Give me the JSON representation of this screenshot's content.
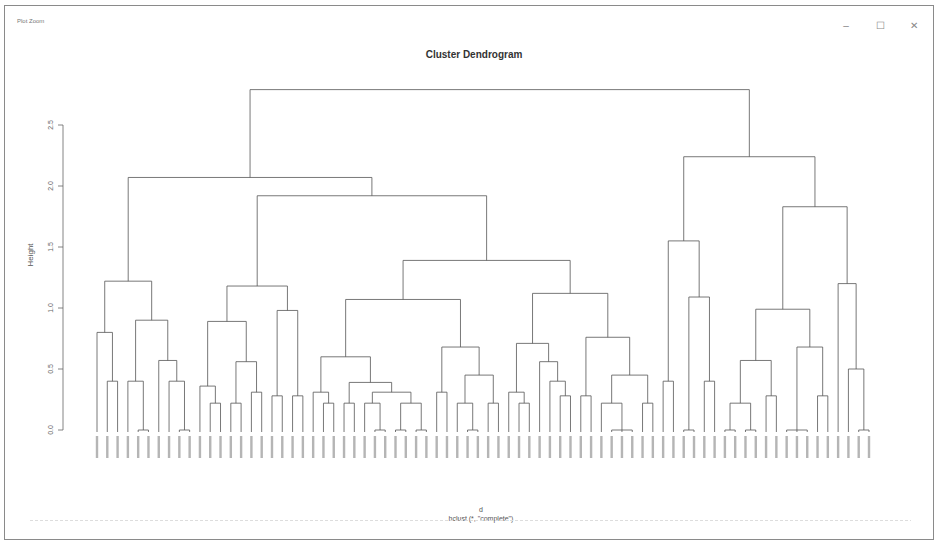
{
  "window": {
    "title": "Plot Zoom",
    "controls": {
      "minimize": "–",
      "maximize": "☐",
      "close": "✕"
    }
  },
  "chart_data": {
    "type": "dendrogram",
    "title": "Cluster Dendrogram",
    "xlabel": "d",
    "sublabel": "hclust (*, \"complete\")",
    "ylabel": "Height",
    "ylim": [
      0,
      2.9
    ],
    "yticks": [
      0.0,
      0.5,
      1.0,
      1.5,
      2.0,
      2.5
    ],
    "ytick_labels": [
      "0.0",
      "0.5",
      "1.0",
      "1.5",
      "2.0",
      "2.5"
    ],
    "leaf_count": 100,
    "leaf_label_style": "numeric IDs (illegible at screenshot resolution)",
    "tree": {
      "h": 2.79,
      "c": [
        {
          "h": 2.07,
          "c": [
            {
              "h": 1.22,
              "c": [
                {
                  "h": 0.8,
                  "c": [
                    "L",
                    {
                      "h": 0.4,
                      "c": [
                        "L",
                        "L"
                      ]
                    }
                  ]
                },
                {
                  "h": 0.9,
                  "c": [
                    {
                      "h": 0.4,
                      "c": [
                        "L",
                        {
                          "h": 0,
                          "c": [
                            "L",
                            "L"
                          ]
                        }
                      ]
                    },
                    {
                      "h": 0.57,
                      "c": [
                        "L",
                        {
                          "h": 0.4,
                          "c": [
                            "L",
                            {
                              "h": 0,
                              "c": [
                                "L",
                                "L"
                              ]
                            }
                          ]
                        }
                      ]
                    }
                  ]
                }
              ]
            },
            {
              "h": 1.92,
              "c": [
                {
                  "h": 1.18,
                  "c": [
                    {
                      "h": 0.89,
                      "c": [
                        {
                          "h": 0.36,
                          "c": [
                            "L",
                            {
                              "h": 0.22,
                              "c": [
                                "L",
                                "L"
                              ]
                            }
                          ]
                        },
                        {
                          "h": 0.56,
                          "c": [
                            {
                              "h": 0.22,
                              "c": [
                                "L",
                                "L"
                              ]
                            },
                            {
                              "h": 0.31,
                              "c": [
                                "L",
                                "L"
                              ]
                            }
                          ]
                        }
                      ]
                    },
                    {
                      "h": 0.98,
                      "c": [
                        {
                          "h": 0.28,
                          "c": [
                            "L",
                            "L"
                          ]
                        },
                        {
                          "h": 0.28,
                          "c": [
                            "L",
                            "L"
                          ]
                        }
                      ]
                    }
                  ]
                },
                {
                  "h": 1.39,
                  "c": [
                    {
                      "h": 1.07,
                      "c": [
                        {
                          "h": 0.6,
                          "c": [
                            {
                              "h": 0.31,
                              "c": [
                                "L",
                                {
                                  "h": 0.22,
                                  "c": [
                                    "L",
                                    "L"
                                  ]
                                }
                              ]
                            },
                            {
                              "h": 0.39,
                              "c": [
                                {
                                  "h": 0.22,
                                  "c": [
                                    "L",
                                    "L"
                                  ]
                                },
                                {
                                  "h": 0.31,
                                  "c": [
                                    {
                                      "h": 0.22,
                                      "c": [
                                        "L",
                                        {
                                          "h": 0,
                                          "c": [
                                            "L",
                                            "L"
                                          ]
                                        }
                                      ]
                                    },
                                    {
                                      "h": 0.22,
                                      "c": [
                                        {
                                          "h": 0,
                                          "c": [
                                            "L",
                                            "L"
                                          ]
                                        },
                                        {
                                          "h": 0,
                                          "c": [
                                            "L",
                                            "L"
                                          ]
                                        }
                                      ]
                                    }
                                  ]
                                }
                              ]
                            }
                          ]
                        },
                        {
                          "h": 0.68,
                          "c": [
                            {
                              "h": 0.31,
                              "c": [
                                "L",
                                "L"
                              ]
                            },
                            {
                              "h": 0.45,
                              "c": [
                                {
                                  "h": 0.22,
                                  "c": [
                                    "L",
                                    {
                                      "h": 0,
                                      "c": [
                                        "L",
                                        "L"
                                      ]
                                    }
                                  ]
                                },
                                {
                                  "h": 0.22,
                                  "c": [
                                    "L",
                                    "L"
                                  ]
                                }
                              ]
                            }
                          ]
                        }
                      ]
                    },
                    {
                      "h": 1.12,
                      "c": [
                        {
                          "h": 0.71,
                          "c": [
                            {
                              "h": 0.31,
                              "c": [
                                "L",
                                {
                                  "h": 0.22,
                                  "c": [
                                    "L",
                                    "L"
                                  ]
                                }
                              ]
                            },
                            {
                              "h": 0.56,
                              "c": [
                                "L",
                                {
                                  "h": 0.4,
                                  "c": [
                                    "L",
                                    {
                                      "h": 0.28,
                                      "c": [
                                        "L",
                                        "L"
                                      ]
                                    }
                                  ]
                                }
                              ]
                            }
                          ]
                        },
                        {
                          "h": 0.76,
                          "c": [
                            {
                              "h": 0.28,
                              "c": [
                                "L",
                                "L"
                              ]
                            },
                            {
                              "h": 0.45,
                              "c": [
                                {
                                  "h": 0.22,
                                  "c": [
                                    "L",
                                    {
                                      "h": 0,
                                      "c": [
                                        "L",
                                        "L",
                                        "L"
                                      ]
                                    }
                                  ]
                                },
                                {
                                  "h": 0.22,
                                  "c": [
                                    "L",
                                    "L"
                                  ]
                                }
                              ]
                            }
                          ]
                        }
                      ]
                    }
                  ]
                }
              ]
            }
          ]
        },
        {
          "h": 2.24,
          "c": [
            {
              "h": 1.55,
              "c": [
                {
                  "h": 0.4,
                  "c": [
                    "L",
                    "L"
                  ]
                },
                {
                  "h": 1.09,
                  "c": [
                    {
                      "h": 0,
                      "c": [
                        "L",
                        "L"
                      ]
                    },
                    {
                      "h": 0.4,
                      "c": [
                        "L",
                        "L"
                      ]
                    }
                  ]
                }
              ]
            },
            {
              "h": 1.83,
              "c": [
                {
                  "h": 0.99,
                  "c": [
                    {
                      "h": 0.57,
                      "c": [
                        {
                          "h": 0.22,
                          "c": [
                            {
                              "h": 0,
                              "c": [
                                "L",
                                "L"
                              ]
                            },
                            {
                              "h": 0,
                              "c": [
                                "L",
                                "L"
                              ]
                            }
                          ]
                        },
                        {
                          "h": 0.28,
                          "c": [
                            "L",
                            "L"
                          ]
                        }
                      ]
                    },
                    {
                      "h": 0.68,
                      "c": [
                        {
                          "h": 0,
                          "c": [
                            "L",
                            "L",
                            "L"
                          ]
                        },
                        {
                          "h": 0.28,
                          "c": [
                            "L",
                            "L"
                          ]
                        }
                      ]
                    }
                  ]
                },
                {
                  "h": 1.2,
                  "c": [
                    "L",
                    {
                      "h": 0.5,
                      "c": [
                        "L",
                        {
                          "h": 0,
                          "c": [
                            "L",
                            "L"
                          ]
                        }
                      ]
                    }
                  ]
                }
              ]
            }
          ]
        }
      ]
    }
  }
}
